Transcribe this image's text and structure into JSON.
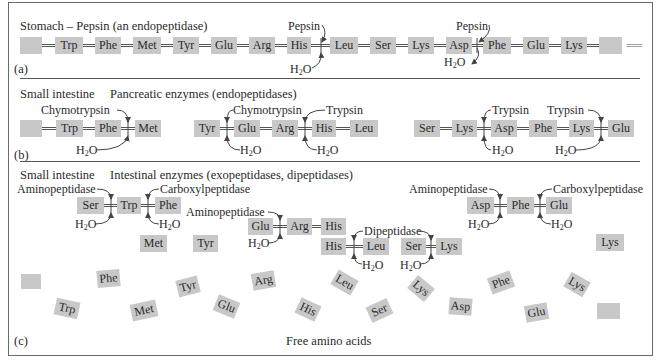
{
  "panels": {
    "a": {
      "tag": "(a)",
      "heading": "Stomach – Pepsin (an endopeptidase)",
      "chain": [
        "",
        "Trp",
        "Phe",
        "Met",
        "Tyr",
        "Glu",
        "Arg",
        "His",
        "Leu",
        "Ser",
        "Lys",
        "Asp",
        "Phe",
        "Glu",
        "Lys",
        ""
      ],
      "continuation": "===",
      "enzymes": [
        {
          "name": "Pepsin",
          "cleaves_between": [
            "His",
            "Leu"
          ],
          "water": "H2O"
        },
        {
          "name": "Pepsin",
          "cleaves_between": [
            "Asp",
            "Phe"
          ],
          "water": "H2O"
        }
      ]
    },
    "b": {
      "tag": "(b)",
      "heading_location": "Small intestine",
      "heading_enzymes": "Pancreatic enzymes (endopeptidases)",
      "fragments": [
        {
          "residues": [
            "",
            "Trp",
            "Phe",
            "Met"
          ],
          "enzymes": [
            {
              "name": "Chymotrypsin",
              "between": [
                "Phe",
                "Met"
              ]
            }
          ]
        },
        {
          "residues": [
            "Tyr",
            "Glu",
            "Arg",
            "His",
            "Leu"
          ],
          "enzymes": [
            {
              "name": "Chymotrypsin",
              "between": [
                "Tyr",
                "Glu"
              ]
            },
            {
              "name": "Trypsin",
              "between": [
                "Arg",
                "His"
              ]
            }
          ]
        },
        {
          "residues": [
            "Ser",
            "Lys",
            "Asp",
            "Phe",
            "Lys",
            "Glu"
          ],
          "enzymes": [
            {
              "name": "Trypsin",
              "between": [
                "Lys",
                "Asp"
              ]
            },
            {
              "name": "Trypsin",
              "between": [
                "Lys",
                "Glu"
              ]
            }
          ]
        }
      ],
      "water": "H2O"
    },
    "c": {
      "tag": "(c)",
      "heading_location": "Small intestine",
      "heading_enzymes": "Intestinal enzymes (exopeptidases, dipeptidases)",
      "enzymes": {
        "aminopeptidase": "Aminopeptidase",
        "carboxylpeptidase": "Carboxylpeptidase",
        "dipeptidase": "Dipeptidase"
      },
      "water": "H2O",
      "fragment1": [
        "Ser",
        "Trp",
        "Phe"
      ],
      "fragment2": [
        "Glu",
        "Arg",
        "His"
      ],
      "dipeptide1": [
        "His",
        "Leu"
      ],
      "dipeptide2": [
        "Ser",
        "Lys"
      ],
      "fragment3": [
        "Asp",
        "Phe",
        "Glu"
      ],
      "released": [
        "Met",
        "Tyr",
        "Lys"
      ],
      "free_amino_acids": [
        "",
        "Trp",
        "Phe",
        "Met",
        "Tyr",
        "Glu",
        "Arg",
        "His",
        "Leu",
        "Ser",
        "Lys",
        "Asp",
        "Phe",
        "Glu",
        "Lys",
        ""
      ],
      "caption": "Free amino acids"
    }
  }
}
